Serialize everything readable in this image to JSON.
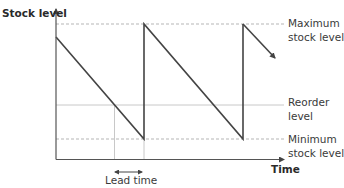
{
  "diagram": {
    "y_axis_label": "Stock level",
    "x_axis_label": "Time",
    "levels": [
      {
        "id": "maximum",
        "line1": "Maximum",
        "line2": "stock level",
        "style": "dashed"
      },
      {
        "id": "reorder",
        "line1": "Reorder",
        "line2": "level",
        "style": "solid"
      },
      {
        "id": "minimum",
        "line1": "Minimum",
        "line2": "stock level",
        "style": "dashed"
      }
    ],
    "annotation": {
      "label": "Lead time",
      "type": "double-arrow"
    },
    "colors": {
      "axis": "#555555",
      "sawtooth": "#444444",
      "guide_lines": "#bbbbbb",
      "text": "#3a3a3a"
    }
  }
}
